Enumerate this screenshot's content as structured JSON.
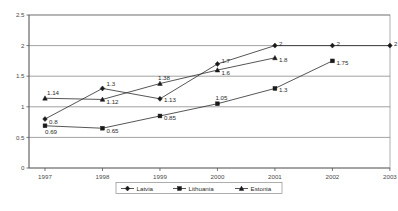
{
  "chart_data": {
    "type": "line",
    "title": "",
    "subtitle": "",
    "xlabel": "",
    "ylabel": "",
    "categories": [
      "1997",
      "1998",
      "1999",
      "2000",
      "2001",
      "2002",
      "2003"
    ],
    "xlim": [
      1997,
      2003
    ],
    "ylim": [
      0,
      2.5
    ],
    "ytick_labels": [
      "0",
      "0.5",
      "1",
      "1.5",
      "2",
      "2.5"
    ],
    "ytick_values": [
      0,
      0.5,
      1,
      1.5,
      2,
      2.5
    ],
    "grid": "horizontal",
    "legend_position": "bottom-center",
    "series": [
      {
        "name": "Latvia",
        "marker": "diamond",
        "x": [
          "1997",
          "1998",
          "1999",
          "2000",
          "2001",
          "2002",
          "2003"
        ],
        "values": [
          0.8,
          1.3,
          1.13,
          1.7,
          2,
          2,
          2
        ],
        "labels": [
          "0.8",
          "1.3",
          "1.13",
          "1.7",
          "2",
          "2",
          "2"
        ]
      },
      {
        "name": "Lithuania",
        "marker": "square",
        "x": [
          "1997",
          "1998",
          "1999",
          "2000",
          "2001",
          "2002"
        ],
        "values": [
          0.69,
          0.65,
          0.85,
          1.05,
          1.3,
          1.75
        ],
        "labels": [
          "0.69",
          "0.65",
          "0.85",
          "1.05",
          "1.3",
          "1.75"
        ]
      },
      {
        "name": "Estonia",
        "marker": "triangle",
        "x": [
          "1997",
          "1998",
          "1999",
          "2000",
          "2001"
        ],
        "values": [
          1.14,
          1.12,
          1.38,
          1.6,
          1.8
        ],
        "labels": [
          "1.14",
          "1.12",
          "1.38",
          "1.6",
          "1.8"
        ]
      }
    ],
    "colors": {
      "series_line": "#2b2b2b",
      "marker": "#1a1a1a",
      "gridline": "#7a7a7a",
      "axis": "#555555",
      "frame": "#8c8c8c",
      "background": "#ffffff",
      "text": "#4a4a4a"
    }
  }
}
